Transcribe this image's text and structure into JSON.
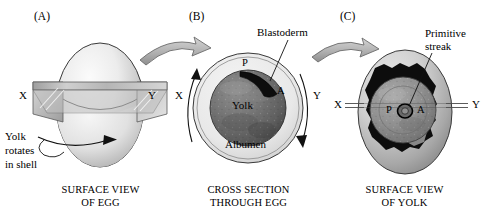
{
  "figure": {
    "background_color": "#ffffff",
    "ink_color": "#000000"
  },
  "panels": [
    {
      "id": "A",
      "label": "(A)",
      "caption_line1": "SURFACE VIEW",
      "caption_line2": "OF EGG",
      "axis_left_label": "X",
      "axis_right_label": "Y",
      "annotation": {
        "line1": "Yolk",
        "line2": "rotates",
        "line3": "in shell"
      },
      "shell_fill_light": "#f2f2f2",
      "shell_fill_dark": "#9a9a9a",
      "plane_fill": "#b9b9b9"
    },
    {
      "id": "B",
      "label": "(B)",
      "caption_line1": "CROSS SECTION",
      "caption_line2": "THROUGH EGG",
      "axis_left_label": "X",
      "axis_right_label": "Y",
      "annotation": {
        "line1": "Blastoderm"
      },
      "inner_labels": {
        "posterior": "P",
        "anterior": "A",
        "yolk": "Yolk",
        "albumen": "Albumen"
      },
      "albumen_fill": "#ebebeb",
      "yolk_fill": "#6e6e6e",
      "blastoderm_fill": "#111111"
    },
    {
      "id": "C",
      "label": "(C)",
      "caption_line1": "SURFACE VIEW",
      "caption_line2": "OF YOLK",
      "axis_left_label": "X",
      "axis_right_label": "Y",
      "annotation": {
        "line1": "Primitive",
        "line2": "streak"
      },
      "inner_labels": {
        "posterior": "P",
        "anterior": "A"
      },
      "yolk_surface_fill": "#c9c9c9",
      "blastoderm_fill": "#111111",
      "disc_fill": "#8d8d8d"
    }
  ],
  "arrows": [
    {
      "name": "arrow-a-to-b",
      "fill": "#b0b0b0"
    },
    {
      "name": "arrow-b-to-c",
      "fill": "#b0b0b0"
    }
  ]
}
